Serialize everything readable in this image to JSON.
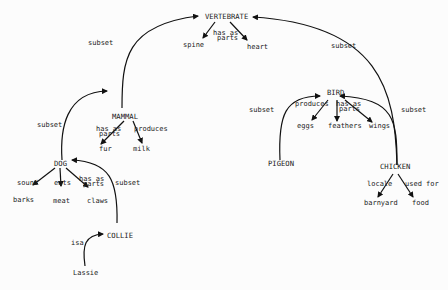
{
  "diagram": {
    "type": "semantic-network",
    "nodes": {
      "vertebrate": "VERTEBRATE",
      "spine": "spine",
      "heart": "heart",
      "mammal": "MAMMAL",
      "fur": "fur",
      "milk": "milk",
      "bird": "BIRD",
      "eggs": "eggs",
      "feathers": "feathers",
      "wings": "wings",
      "pigeon": "PIGEON",
      "chicken": "CHICKEN",
      "barnyard": "barnyard",
      "food": "food",
      "dog": "DOG",
      "barks": "barks",
      "meat": "meat",
      "claws": "claws",
      "collie": "COLLIE",
      "lassie": "Lassie"
    },
    "edge_labels": {
      "mammal_vertebrate": "subset",
      "bird_vertebrate": "subset",
      "vertebrate_parts_1": "has as",
      "vertebrate_parts_2": "parts",
      "mammal_parts_1": "has as",
      "mammal_parts_2": "parts",
      "mammal_produces": "produces",
      "bird_produces": "produces",
      "bird_parts_1": "has as",
      "bird_parts_2": "parts",
      "pigeon_bird": "subset",
      "chicken_bird": "subset",
      "chicken_locale": "locale",
      "chicken_used_for": "used for",
      "dog_mammal": "subset",
      "dog_sound": "sound",
      "dog_eats": "eats",
      "dog_parts_1": "has as",
      "dog_parts_2": "parts",
      "collie_dog": "subset",
      "lassie_collie": "isa"
    }
  }
}
